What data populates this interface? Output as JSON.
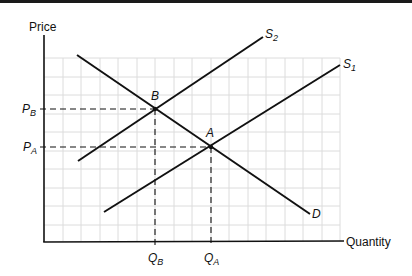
{
  "diagram": {
    "type": "supply-demand shift",
    "axes": {
      "y_label": "Price",
      "x_label": "Quantity"
    },
    "curves": [
      {
        "id": "D",
        "label": "D",
        "kind": "demand"
      },
      {
        "id": "S1",
        "label": "S",
        "sub": "1",
        "kind": "supply"
      },
      {
        "id": "S2",
        "label": "S",
        "sub": "2",
        "kind": "supply"
      }
    ],
    "equilibria": [
      {
        "id": "A",
        "label": "A",
        "price_label": "P",
        "price_sub": "A",
        "qty_label": "Q",
        "qty_sub": "A"
      },
      {
        "id": "B",
        "label": "B",
        "price_label": "P",
        "price_sub": "B",
        "qty_label": "Q",
        "qty_sub": "B"
      }
    ],
    "colors": {
      "line": "#111111",
      "grid": "#dcdcdc",
      "background": "#ffffff"
    }
  }
}
